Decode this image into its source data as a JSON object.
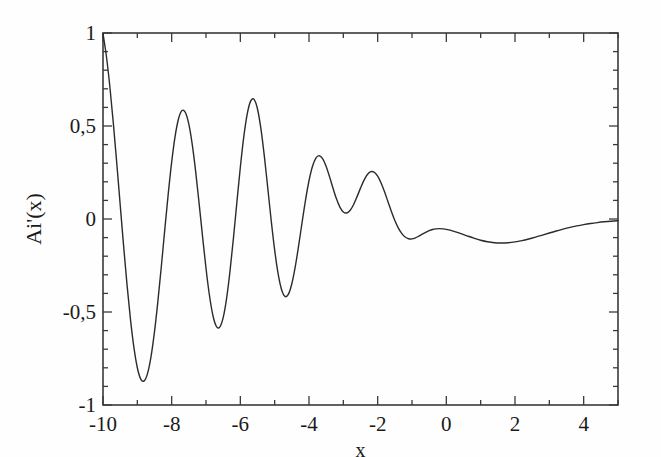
{
  "chart_data": {
    "type": "line",
    "title": "",
    "subtitle": "",
    "xlabel": "x",
    "ylabel": "Ai'(x)",
    "xlim": [
      -10,
      5
    ],
    "ylim": [
      -1,
      1
    ],
    "grid": false,
    "legend": null,
    "decimal_separator": ",",
    "x_major_ticks": [
      -10,
      -8,
      -6,
      -4,
      -2,
      0,
      2,
      4
    ],
    "x_major_tick_labels": [
      "-10",
      "-8",
      "-6",
      "-4",
      "-2",
      "0",
      "2",
      "4"
    ],
    "x_minor_tick_step": 1,
    "y_major_ticks": [
      -1,
      -0.5,
      0,
      0.5,
      1
    ],
    "y_major_tick_labels": [
      "-1",
      "-0,5",
      "0",
      "0,5",
      "1"
    ],
    "y_minor_tick_step": 0.1,
    "line_color": "#2b2b2b",
    "line_width": 1.4,
    "background_color": "#fefefe",
    "frame_color": "#3a3a3a",
    "series": [
      {
        "name": "Ai'(x)",
        "x": [
          -10.0,
          -9.9,
          -9.8,
          -9.7,
          -9.6,
          -9.5,
          -9.4,
          -9.3,
          -9.2,
          -9.1,
          -9.0,
          -8.9,
          -8.8,
          -8.7,
          -8.6,
          -8.5,
          -8.4,
          -8.3,
          -8.2,
          -8.1,
          -8.0,
          -7.9,
          -7.8,
          -7.7,
          -7.6,
          -7.5,
          -7.4,
          -7.3,
          -7.2,
          -7.1,
          -7.0,
          -6.9,
          -6.8,
          -6.7,
          -6.6,
          -6.5,
          -6.4,
          -6.3,
          -6.2,
          -6.1,
          -6.0,
          -5.9,
          -5.8,
          -5.7,
          -5.6,
          -5.5,
          -5.4,
          -5.3,
          -5.2,
          -5.1,
          -5.0,
          -4.9,
          -4.8,
          -4.7,
          -4.6,
          -4.5,
          -4.4,
          -4.3,
          -4.2,
          -4.1,
          -4.0,
          -3.9,
          -3.8,
          -3.7,
          -3.6,
          -3.5,
          -3.4,
          -3.3,
          -3.2,
          -3.1,
          -3.0,
          -2.9,
          -2.8,
          -2.7,
          -2.6,
          -2.5,
          -2.4,
          -2.3,
          -2.2,
          -2.1,
          -2.0,
          -1.9,
          -1.8,
          -1.7,
          -1.6,
          -1.5,
          -1.4,
          -1.3,
          -1.2,
          -1.1,
          -1.0,
          -0.9,
          -0.8,
          -0.7,
          -0.6,
          -0.5,
          -0.4,
          -0.3,
          -0.2,
          -0.1,
          0.0,
          0.2,
          0.4,
          0.6,
          0.8,
          1.0,
          1.2,
          1.4,
          1.6,
          1.8,
          2.0,
          2.2,
          2.4,
          2.6,
          2.8,
          3.0,
          3.2,
          3.4,
          3.6,
          3.8,
          4.0,
          4.2,
          4.4,
          4.6,
          4.8,
          5.0
        ],
        "y": [
          0.9963,
          0.8735,
          0.7108,
          0.517,
          0.3023,
          0.0779,
          -0.1446,
          -0.354,
          -0.5393,
          -0.6906,
          -0.7998,
          -0.8608,
          -0.8704,
          -0.8286,
          -0.7383,
          -0.6057,
          -0.44,
          -0.2524,
          -0.056,
          0.1349,
          0.306,
          0.4442,
          0.5389,
          0.5828,
          0.5727,
          0.5098,
          0.3999,
          0.2531,
          0.0829,
          -0.0951,
          -0.2646,
          -0.41,
          -0.5175,
          -0.5766,
          -0.5812,
          -0.5298,
          -0.4263,
          -0.2791,
          -0.1012,
          0.0908,
          0.278,
          0.4415,
          0.5644,
          0.634,
          0.6432,
          0.5914,
          0.4849,
          0.3365,
          0.1645,
          -0.0092,
          -0.1671,
          -0.294,
          -0.379,
          -0.4161,
          -0.4043,
          -0.3481,
          -0.2562,
          -0.1409,
          -0.0166,
          0.1029,
          0.2056,
          0.2823,
          0.3276,
          0.3404,
          0.3233,
          0.2825,
          0.2266,
          0.1653,
          0.1084,
          0.0641,
          0.038,
          0.0325,
          0.047,
          0.0782,
          0.1203,
          0.166,
          0.2079,
          0.239,
          0.2544,
          0.2514,
          0.2303,
          0.1936,
          0.1461,
          0.0931,
          0.0403,
          -0.0078,
          -0.0478,
          -0.0777,
          -0.0969,
          -0.1061,
          -0.1069,
          -0.1015,
          -0.0923,
          -0.0817,
          -0.0713,
          -0.0627,
          -0.0565,
          -0.053,
          -0.0519,
          -0.0531,
          -0.0559,
          -0.065,
          -0.0771,
          -0.0903,
          -0.103,
          -0.114,
          -0.1223,
          -0.1275,
          -0.1293,
          -0.1278,
          -0.1233,
          -0.1163,
          -0.1074,
          -0.0972,
          -0.0863,
          -0.0752,
          -0.0645,
          -0.0544,
          -0.0452,
          -0.0371,
          -0.0301,
          -0.0242,
          -0.0192,
          -0.0151,
          -0.0118,
          -0.0091
        ],
        "color": "#2b2b2b"
      }
    ],
    "annotations": {
      "peaks": [
        {
          "x": -7.94,
          "y": 0.93
        },
        {
          "x": -5.52,
          "y": 0.87
        },
        {
          "x": -2.34,
          "y": 0.7
        }
      ],
      "troughs": [
        {
          "x": -9.02,
          "y": -0.97
        },
        {
          "x": -6.79,
          "y": -0.9
        },
        {
          "x": -4.09,
          "y": -0.8
        },
        {
          "x": 0.0,
          "y": -0.26
        }
      ]
    }
  },
  "axes": {
    "x_axis_label": "x",
    "y_axis_label": "Ai'(x)"
  }
}
